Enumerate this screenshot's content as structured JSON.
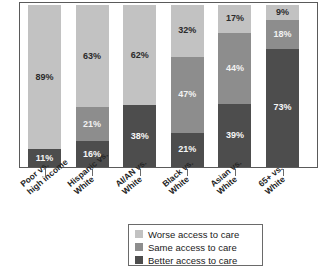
{
  "chart_data": {
    "type": "bar",
    "subtype": "stacked-bar-100-percent",
    "title": "",
    "subtitle": "",
    "xlabel": "",
    "ylabel": "",
    "ylim": [
      0,
      100
    ],
    "grid": false,
    "legend_position": "bottom-center",
    "units": "%",
    "categories": [
      "Poor vs. high income",
      "Hispanic vs. White",
      "AI/AN vs. White",
      "Black vs. White",
      "Asian vs. White",
      "65+ vs. White"
    ],
    "category_lines": [
      [
        "Poor vs.",
        "high income"
      ],
      [
        "Hispanic vs.",
        "White"
      ],
      [
        "AI/AN vs.",
        "White"
      ],
      [
        "Black vs.",
        "White"
      ],
      [
        "Asian vs.",
        "White"
      ],
      [
        "65+ vs.",
        "White"
      ]
    ],
    "series": [
      {
        "name": "Worse access to care",
        "color": "#c2c2c2",
        "values": [
          89,
          63,
          62,
          32,
          17,
          9
        ],
        "labels": [
          "89%",
          "63%",
          "62%",
          "32%",
          "17%",
          "9%"
        ]
      },
      {
        "name": "Same access to care",
        "color": "#8d8d8d",
        "values": [
          0,
          21,
          0,
          47,
          44,
          18
        ],
        "labels": [
          "",
          "21%",
          "",
          "47%",
          "44%",
          "18%"
        ]
      },
      {
        "name": "Better access to care",
        "color": "#4d4d4d",
        "values": [
          11,
          16,
          38,
          21,
          39,
          73
        ],
        "labels": [
          "11%",
          "16%",
          "38%",
          "21%",
          "39%",
          "73%"
        ]
      }
    ]
  },
  "legend": {
    "items": [
      {
        "label": "Worse access to care",
        "swatch": "worse"
      },
      {
        "label": "Same access to care",
        "swatch": "same"
      },
      {
        "label": "Better access to care",
        "swatch": "better"
      }
    ]
  }
}
